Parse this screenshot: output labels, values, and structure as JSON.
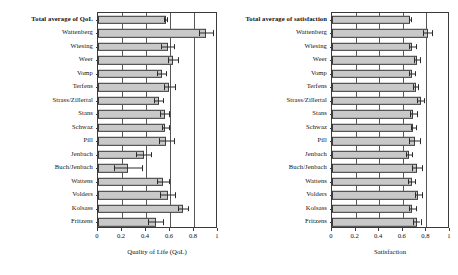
{
  "figure": {
    "background": "#ffffff",
    "bar_fill": "#c9c9c9",
    "bar_stroke": "#3d3d3d",
    "axis_color": "#3a3a3a"
  },
  "chart_data": [
    {
      "type": "bar",
      "orientation": "horizontal",
      "panel": "left",
      "title": "",
      "xlabel": "Quality of Life (QoL)",
      "ylabel": "",
      "xlim": [
        0,
        1
      ],
      "xticks": [
        "0",
        "0.2",
        "0.4",
        "0.6",
        "0.8",
        "1"
      ],
      "xtick_values": [
        0,
        0.2,
        0.4,
        0.6,
        0.8,
        1
      ],
      "grid": true,
      "legend": "none",
      "error_bars": "symmetric",
      "categories": [
        "Total average of QoL",
        "Wattenberg",
        "Wiesing",
        "Weer",
        "Vomp",
        "Terfens",
        "Strass/Zillertal",
        "Stans",
        "Schwaz",
        "Pill",
        "Jenbach",
        "Buch/Jenbach",
        "Wattens",
        "Volders",
        "Kolsass",
        "Fritzens"
      ],
      "values": [
        0.565,
        0.9,
        0.58,
        0.625,
        0.53,
        0.595,
        0.505,
        0.555,
        0.56,
        0.57,
        0.38,
        0.25,
        0.54,
        0.58,
        0.71,
        0.48
      ],
      "errors": [
        0.012,
        0.055,
        0.055,
        0.045,
        0.04,
        0.045,
        0.035,
        0.035,
        0.03,
        0.06,
        0.06,
        0.115,
        0.05,
        0.06,
        0.04,
        0.06
      ]
    },
    {
      "type": "bar",
      "orientation": "horizontal",
      "panel": "right",
      "title": "",
      "xlabel": "Satisfaction",
      "ylabel": "",
      "xlim": [
        0,
        1
      ],
      "xticks": [
        "0",
        "0.2",
        "0.4",
        "0.6",
        "0.8",
        "1"
      ],
      "xtick_values": [
        0,
        0.2,
        0.4,
        0.6,
        0.8,
        1
      ],
      "grid": true,
      "legend": "none",
      "error_bars": "symmetric",
      "categories": [
        "Total average of satisfaction",
        "Wattenberg",
        "Wiesing",
        "Weer",
        "Vomp",
        "Terfens",
        "Strass/Zillertal",
        "Stans",
        "Schwaz",
        "Pill",
        "Jenbach",
        "Buch/Jenbach",
        "Wattens",
        "Volders",
        "Kolsass",
        "Fritzens"
      ],
      "values": [
        0.66,
        0.81,
        0.68,
        0.72,
        0.675,
        0.71,
        0.75,
        0.69,
        0.69,
        0.7,
        0.65,
        0.72,
        0.675,
        0.73,
        0.68,
        0.72
      ],
      "errors": [
        0.008,
        0.04,
        0.03,
        0.025,
        0.025,
        0.02,
        0.03,
        0.03,
        0.02,
        0.045,
        0.025,
        0.045,
        0.03,
        0.03,
        0.03,
        0.03
      ]
    }
  ]
}
